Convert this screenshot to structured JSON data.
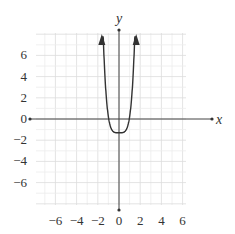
{
  "chart_data": {
    "type": "line",
    "title": "",
    "xlabel": "x",
    "ylabel": "y",
    "xlim": [
      -8,
      6.5
    ],
    "ylim": [
      -8,
      8.5
    ],
    "grid": true,
    "x_ticks": [
      -6,
      -4,
      -2,
      0,
      2,
      4,
      6
    ],
    "y_ticks": [
      6,
      4,
      2,
      0,
      -2,
      -4,
      -6
    ],
    "x_tick_labels": [
      "−6",
      "−4",
      "−2",
      "0",
      "2",
      "4",
      "6"
    ],
    "y_tick_labels": [
      "6",
      "4",
      "2",
      "0",
      "−2",
      "−4",
      "−6"
    ],
    "series": [
      {
        "name": "f(x)",
        "description": "Even quartic-like curve, flat minimum near (0, -1.3), rising steeply with arrows upward near x = ±1.6",
        "x": [
          -1.6,
          -1.4,
          -1.2,
          -1.0,
          -0.8,
          -0.6,
          -0.4,
          -0.2,
          0,
          0.2,
          0.4,
          0.6,
          0.8,
          1.0,
          1.2,
          1.4,
          1.6
        ],
        "y": [
          8.0,
          4.6,
          2.1,
          0.45,
          -0.6,
          -1.1,
          -1.28,
          -1.3,
          -1.3,
          -1.3,
          -1.28,
          -1.1,
          -0.6,
          0.45,
          2.1,
          4.6,
          8.0
        ],
        "color": "#333333",
        "arrows": "both ends upward"
      }
    ]
  },
  "labels": {
    "x_axis": "x",
    "y_axis": "y"
  }
}
